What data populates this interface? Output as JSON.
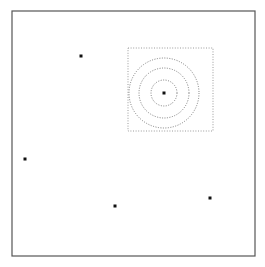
{
  "figure": {
    "title": "",
    "width": 265,
    "height": 267,
    "background_color": "#ffffff"
  },
  "plot_frame": {
    "name": "plot-border",
    "x": 12,
    "y": 11,
    "width": 243,
    "height": 245,
    "stroke_color": "#555555",
    "stroke_width": 1.2,
    "fill": "none"
  },
  "region_box": {
    "name": "dotted-bounding-box",
    "x": 128,
    "y": 48,
    "width": 85,
    "height": 83,
    "stroke_color": "#9a9a9a",
    "stroke_width": 1,
    "dash_pattern": "1,1.6",
    "fill": "none"
  },
  "contours": {
    "center_x": 164,
    "center_y": 93,
    "stroke_color": "#7a7a7a",
    "stroke_width": 1,
    "dash_pattern": "1,1.5",
    "rings": [
      {
        "label": "inner-contour",
        "radius": 13
      },
      {
        "label": "middle-contour",
        "radius": 25
      },
      {
        "label": "outer-contour",
        "radius": 35
      }
    ]
  },
  "data_points": {
    "marker_color": "#111111",
    "marker_size": 3,
    "marker_shape": "square",
    "points": [
      {
        "label": "point-1",
        "x": 81,
        "y": 56
      },
      {
        "label": "point-2",
        "x": 164,
        "y": 93
      },
      {
        "label": "point-3",
        "x": 25,
        "y": 159
      },
      {
        "label": "point-4",
        "x": 210,
        "y": 198
      },
      {
        "label": "point-5",
        "x": 115,
        "y": 206
      }
    ]
  },
  "chart_data": {
    "type": "scatter",
    "title": "",
    "xlabel": "",
    "ylabel": "",
    "grid": false,
    "legend": "none",
    "xlim": [
      0,
      265
    ],
    "ylim": [
      0,
      267
    ],
    "axis_ticks": [],
    "series": [
      {
        "name": "points",
        "marker": "square",
        "color": "#111111",
        "x": [
          81,
          164,
          25,
          210,
          115
        ],
        "y": [
          56,
          93,
          159,
          198,
          206
        ]
      }
    ],
    "annotations": [
      {
        "kind": "dashed-rectangle",
        "x": 128,
        "y": 48,
        "width": 85,
        "height": 83
      },
      {
        "kind": "dashed-circle",
        "cx": 164,
        "cy": 93,
        "r": 13
      },
      {
        "kind": "dashed-circle",
        "cx": 164,
        "cy": 93,
        "r": 25
      },
      {
        "kind": "dashed-circle",
        "cx": 164,
        "cy": 93,
        "r": 35
      }
    ]
  }
}
